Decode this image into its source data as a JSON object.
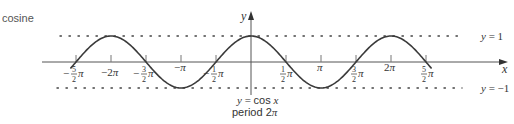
{
  "title": "cosine",
  "chart_data": {
    "type": "line",
    "title": "cosine",
    "function": "y = cos x",
    "caption": [
      "y = cos x",
      "period 2π"
    ],
    "xlabel": "x",
    "ylabel": "y",
    "xlim": [
      -2.6,
      2.6
    ],
    "xlim_units": "π",
    "ylim": [
      -1,
      1
    ],
    "x_ticks": [
      "-5/2π",
      "-2π",
      "-3/2π",
      "-π",
      "-1/2π",
      "1/2π",
      "π",
      "3/2π",
      "2π",
      "5/2π"
    ],
    "x_tick_values_pi": [
      -2.5,
      -2,
      -1.5,
      -1,
      -0.5,
      0.5,
      1,
      1.5,
      2,
      2.5
    ],
    "reference_lines": [
      {
        "label": "y = 1",
        "y": 1,
        "style": "dotted"
      },
      {
        "label": "y = -1",
        "y": -1,
        "style": "dotted"
      }
    ],
    "period": "2π",
    "grid": false
  },
  "labels": {
    "x_axis": "x",
    "y_axis": "y",
    "y_eq_1": "y = 1",
    "y_eq_neg1": "y = −1",
    "caption_fn": "y = cos x",
    "caption_period": "period 2π"
  }
}
